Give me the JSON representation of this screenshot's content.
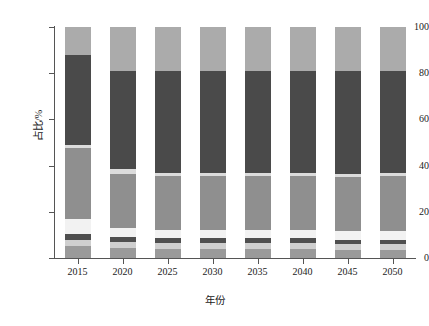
{
  "chart_data": {
    "type": "bar",
    "subtype": "stacked-100-percent",
    "title": "",
    "xlabel": "年份",
    "ylabel": "占比/%",
    "categories": [
      "2015",
      "2020",
      "2025",
      "2030",
      "2035",
      "2040",
      "2045",
      "2050"
    ],
    "ylim": [
      0,
      100
    ],
    "yticks": [
      0,
      20,
      40,
      60,
      80,
      100
    ],
    "ytick_labels": [
      "0",
      "20",
      "40",
      "60",
      "80",
      "100"
    ],
    "grid": false,
    "legend": "none",
    "orientation": "vertical",
    "series": [
      {
        "name": "series-1",
        "color": "#9a9a9a",
        "values": [
          5.0,
          4.5,
          4.0,
          4.0,
          4.0,
          4.0,
          3.5,
          3.5
        ]
      },
      {
        "name": "series-2",
        "color": "#cfcfcf",
        "values": [
          3.0,
          2.5,
          2.5,
          2.5,
          2.5,
          2.5,
          2.5,
          2.5
        ]
      },
      {
        "name": "series-3",
        "color": "#4f4f4f",
        "values": [
          2.5,
          2.0,
          2.0,
          2.0,
          2.0,
          2.0,
          2.0,
          2.0
        ]
      },
      {
        "name": "series-4",
        "color": "#f2f2f2",
        "values": [
          6.5,
          4.0,
          3.5,
          3.5,
          3.5,
          3.5,
          3.5,
          3.5
        ]
      },
      {
        "name": "series-5",
        "color": "#8f8f8f",
        "values": [
          30.5,
          23.5,
          23.5,
          23.5,
          23.5,
          23.5,
          23.5,
          24.0
        ]
      },
      {
        "name": "series-6",
        "color": "#dcdcdc",
        "values": [
          1.5,
          2.0,
          1.5,
          1.5,
          1.5,
          1.5,
          1.5,
          1.5
        ]
      },
      {
        "name": "series-7",
        "color": "#4a4a4a",
        "values": [
          39.0,
          42.5,
          44.0,
          44.0,
          44.0,
          44.0,
          44.5,
          44.0
        ]
      },
      {
        "name": "series-8",
        "color": "#ababab",
        "values": [
          12.0,
          19.0,
          19.0,
          19.0,
          19.0,
          19.0,
          19.0,
          19.0
        ]
      }
    ]
  },
  "axes": {
    "y_title": "占比/%",
    "x_title": "年份"
  }
}
